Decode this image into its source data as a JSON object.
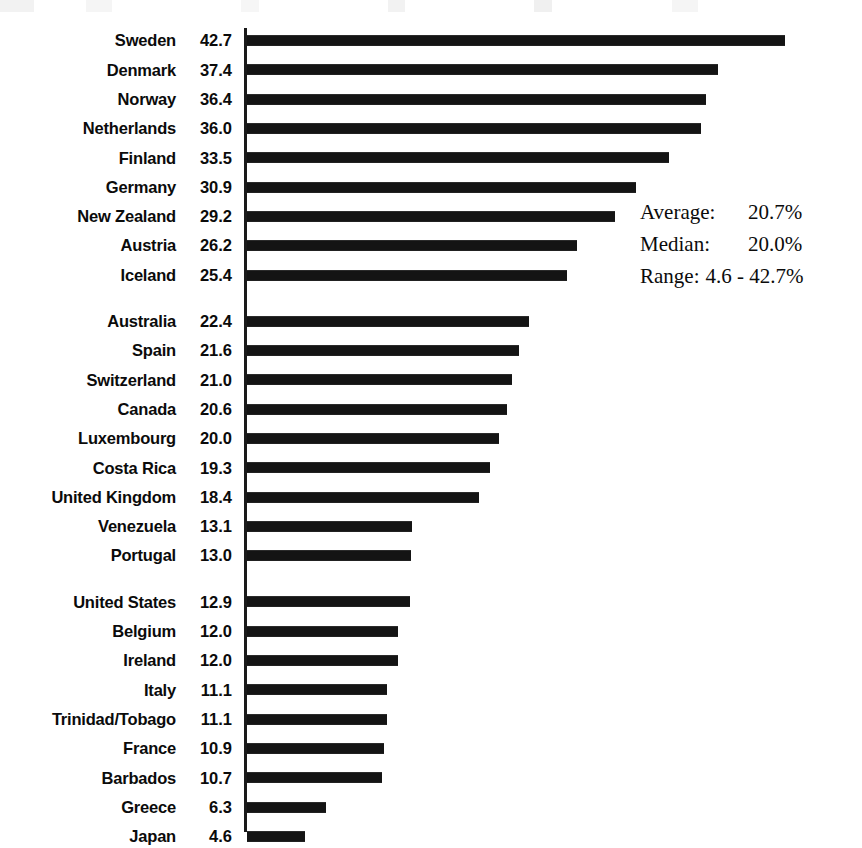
{
  "chart_data": {
    "type": "bar",
    "orientation": "horizontal",
    "title": "",
    "xlabel": "",
    "ylabel": "",
    "xlim": [
      0,
      42.7
    ],
    "grid": false,
    "legend": false,
    "unit": "%",
    "categories": [
      "Sweden",
      "Denmark",
      "Norway",
      "Netherlands",
      "Finland",
      "Germany",
      "New Zealand",
      "Austria",
      "Iceland",
      "Australia",
      "Spain",
      "Switzerland",
      "Canada",
      "Luxembourg",
      "Costa Rica",
      "United Kingdom",
      "Venezuela",
      "Portugal",
      "United States",
      "Belgium",
      "Ireland",
      "Italy",
      "Trinidad/Tobago",
      "France",
      "Barbados",
      "Greece",
      "Japan"
    ],
    "values": [
      42.7,
      37.4,
      36.4,
      36.0,
      33.5,
      30.9,
      29.2,
      26.2,
      25.4,
      22.4,
      21.6,
      21.0,
      20.6,
      20.0,
      19.3,
      18.4,
      13.1,
      13.0,
      12.9,
      12.0,
      12.0,
      11.1,
      11.1,
      10.9,
      10.7,
      6.3,
      4.6
    ],
    "group_breaks_after": [
      "Iceland",
      "Portugal"
    ]
  },
  "rows": [
    {
      "label": "Sweden",
      "value": "42.7",
      "v": 42.7,
      "gap": false
    },
    {
      "label": "Denmark",
      "value": "37.4",
      "v": 37.4,
      "gap": false
    },
    {
      "label": "Norway",
      "value": "36.4",
      "v": 36.4,
      "gap": false
    },
    {
      "label": "Netherlands",
      "value": "36.0",
      "v": 36.0,
      "gap": false
    },
    {
      "label": "Finland",
      "value": "33.5",
      "v": 33.5,
      "gap": false
    },
    {
      "label": "Germany",
      "value": "30.9",
      "v": 30.9,
      "gap": false
    },
    {
      "label": "New Zealand",
      "value": "29.2",
      "v": 29.2,
      "gap": false
    },
    {
      "label": "Austria",
      "value": "26.2",
      "v": 26.2,
      "gap": false
    },
    {
      "label": "Iceland",
      "value": "25.4",
      "v": 25.4,
      "gap": false
    },
    {
      "label": "Australia",
      "value": "22.4",
      "v": 22.4,
      "gap": true
    },
    {
      "label": "Spain",
      "value": "21.6",
      "v": 21.6,
      "gap": false
    },
    {
      "label": "Switzerland",
      "value": "21.0",
      "v": 21.0,
      "gap": false
    },
    {
      "label": "Canada",
      "value": "20.6",
      "v": 20.6,
      "gap": false
    },
    {
      "label": "Luxembourg",
      "value": "20.0",
      "v": 20.0,
      "gap": false
    },
    {
      "label": "Costa Rica",
      "value": "19.3",
      "v": 19.3,
      "gap": false
    },
    {
      "label": "United Kingdom",
      "value": "18.4",
      "v": 18.4,
      "gap": false
    },
    {
      "label": "Venezuela",
      "value": "13.1",
      "v": 13.1,
      "gap": false
    },
    {
      "label": "Portugal",
      "value": "13.0",
      "v": 13.0,
      "gap": false
    },
    {
      "label": "United States",
      "value": "12.9",
      "v": 12.9,
      "gap": true
    },
    {
      "label": "Belgium",
      "value": "12.0",
      "v": 12.0,
      "gap": false
    },
    {
      "label": "Ireland",
      "value": "12.0",
      "v": 12.0,
      "gap": false
    },
    {
      "label": "Italy",
      "value": "11.1",
      "v": 11.1,
      "gap": false
    },
    {
      "label": "Trinidad/Tobago",
      "value": "11.1",
      "v": 11.1,
      "gap": false
    },
    {
      "label": "France",
      "value": "10.9",
      "v": 10.9,
      "gap": false
    },
    {
      "label": "Barbados",
      "value": "10.7",
      "v": 10.7,
      "gap": false
    },
    {
      "label": "Greece",
      "value": "6.3",
      "v": 6.3,
      "gap": false
    },
    {
      "label": "Japan",
      "value": "4.6",
      "v": 4.6,
      "gap": false
    }
  ],
  "stats": {
    "average_label": "Average:",
    "average_value": "20.7%",
    "median_label": "Median:",
    "median_value": "20.0%",
    "range_label": "Range:",
    "range_value": "4.6 - 42.7%"
  },
  "style": {
    "bar_color": "#141414",
    "text_color": "#0b0b0b",
    "background": "#ffffff",
    "px_per_unit": 12.6
  }
}
